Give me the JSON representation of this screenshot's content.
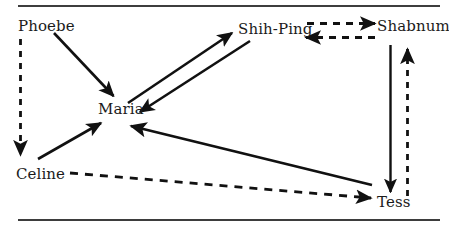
{
  "figure": {
    "type": "sociogram",
    "width": 449,
    "height": 233,
    "background_color": "#ffffff",
    "line_color": "#111111",
    "rule_color": "#3d3d3d"
  },
  "rules": {
    "top_label": "top-rule",
    "bottom_label": "bottom-rule"
  },
  "nodes": [
    {
      "id": "phoebe",
      "label": "Phoebe",
      "x": 18,
      "y": 18
    },
    {
      "id": "shih-ping",
      "label": "Shih-Ping",
      "x": 238,
      "y": 21
    },
    {
      "id": "shabnum",
      "label": "Shabnum",
      "x": 377,
      "y": 18
    },
    {
      "id": "maria",
      "label": "Maria",
      "x": 98,
      "y": 101
    },
    {
      "id": "celine",
      "label": "Celine",
      "x": 16,
      "y": 166
    },
    {
      "id": "tess",
      "label": "Tess",
      "x": 377,
      "y": 194
    }
  ],
  "edges": [
    {
      "id": "phoebe-to-maria",
      "from": "Phoebe",
      "to": "Maria",
      "style": "solid",
      "arrow": "single"
    },
    {
      "id": "phoebe-to-celine",
      "from": "Phoebe",
      "to": "Celine",
      "style": "dashed",
      "arrow": "single"
    },
    {
      "id": "maria-to-shih-ping",
      "from": "Maria",
      "to": "Shih-Ping",
      "style": "solid",
      "arrow": "single"
    },
    {
      "id": "shih-ping-to-maria",
      "from": "Shih-Ping",
      "to": "Maria",
      "style": "solid",
      "arrow": "single"
    },
    {
      "id": "shih-ping-to-shabnum",
      "from": "Shih-Ping",
      "to": "Shabnum",
      "style": "dashed",
      "arrow": "single"
    },
    {
      "id": "shabnum-to-shih-ping",
      "from": "Shabnum",
      "to": "Shih-Ping",
      "style": "dashed",
      "arrow": "single"
    },
    {
      "id": "celine-to-maria",
      "from": "Celine",
      "to": "Maria",
      "style": "solid",
      "arrow": "single"
    },
    {
      "id": "celine-to-tess",
      "from": "Celine",
      "to": "Tess",
      "style": "dashed",
      "arrow": "single"
    },
    {
      "id": "tess-to-maria",
      "from": "Tess",
      "to": "Maria",
      "style": "solid",
      "arrow": "single"
    },
    {
      "id": "shabnum-to-tess",
      "from": "Shabnum",
      "to": "Tess",
      "style": "solid",
      "arrow": "single"
    },
    {
      "id": "tess-to-shabnum",
      "from": "Tess",
      "to": "Shabnum",
      "style": "dashed",
      "arrow": "single"
    }
  ]
}
